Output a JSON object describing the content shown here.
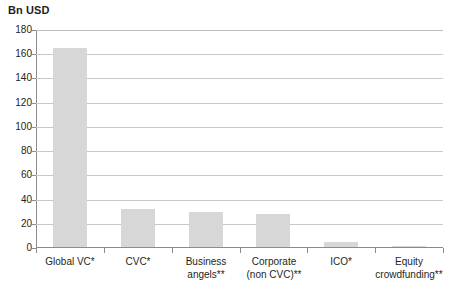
{
  "chart_data": {
    "type": "bar",
    "title": "Bn USD",
    "xlabel": "",
    "ylabel": "Bn USD",
    "categories": [
      "Global VC*",
      "CVC*",
      "Business angels**",
      "Corporate (non CVC)**",
      "ICO*",
      "Equity crowdfunding**"
    ],
    "category_lines": [
      [
        "Global VC*"
      ],
      [
        "CVC*"
      ],
      [
        "Business",
        "angels**"
      ],
      [
        "Corporate",
        "(non CVC)**"
      ],
      [
        "ICO*"
      ],
      [
        "Equity",
        "crowdfunding**"
      ]
    ],
    "values": [
      164,
      31,
      29,
      27,
      4,
      1
    ],
    "ylim": [
      0,
      180
    ],
    "yticks": [
      0,
      20,
      40,
      60,
      80,
      100,
      120,
      140,
      160,
      180
    ],
    "ytick_labels": [
      "0",
      "20",
      "40",
      "60",
      "80",
      "100",
      "120",
      "140",
      "160",
      "180"
    ],
    "grid": true,
    "legend": false,
    "bar_color": "#d7d7d7",
    "grid_color": "#c9c9c9",
    "axis_color": "#8b8b8b",
    "text_color": "#231f20"
  }
}
